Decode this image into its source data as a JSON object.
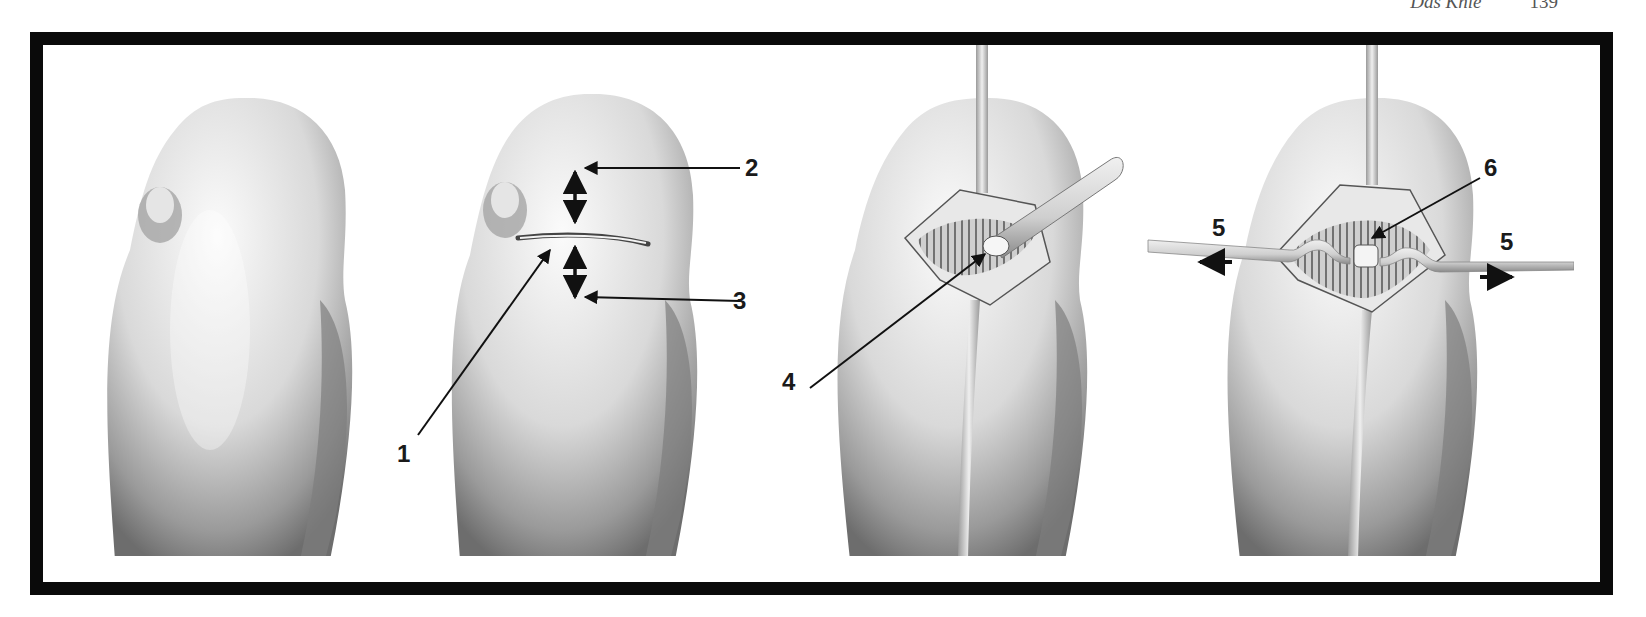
{
  "header": {
    "running_title": "Das Knie",
    "page_number": "139"
  },
  "figure": {
    "panels": [
      {
        "id": 1,
        "description": "intact knee, anterior view"
      },
      {
        "id": 2,
        "description": "transverse skin incision with distances marked"
      },
      {
        "id": 3,
        "description": "opened joint capsule with arthroscope/probe"
      },
      {
        "id": 4,
        "description": "retracted capsule with traction tapes"
      }
    ],
    "labels": [
      {
        "text": "1"
      },
      {
        "text": "2"
      },
      {
        "text": "3"
      },
      {
        "text": "4"
      },
      {
        "text": "5"
      },
      {
        "text": "5"
      },
      {
        "text": "6"
      }
    ]
  }
}
